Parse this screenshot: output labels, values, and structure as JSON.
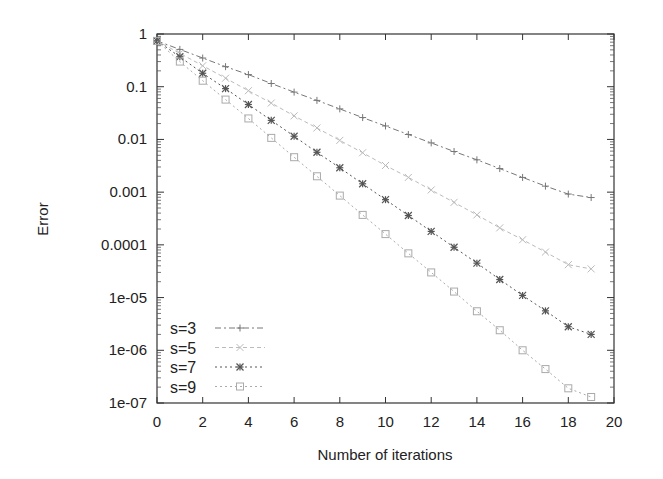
{
  "chart_data": {
    "type": "line",
    "title": "",
    "xlabel": "Number of iterations",
    "ylabel": "Error",
    "xscale": "linear",
    "yscale": "log",
    "xlim": [
      0,
      20
    ],
    "ylim": [
      1e-07,
      1
    ],
    "grid": false,
    "legend_position": "lower left",
    "x_ticks": [
      "0",
      "2",
      "4",
      "6",
      "8",
      "10",
      "12",
      "14",
      "16",
      "18",
      "20"
    ],
    "y_ticks": [
      "1",
      "0.1",
      "0.01",
      "0.001",
      "0.0001",
      "1e-05",
      "1e-06",
      "1e-07"
    ],
    "x": [
      0,
      1,
      2,
      3,
      4,
      5,
      6,
      7,
      8,
      9,
      10,
      11,
      12,
      13,
      14,
      15,
      16,
      17,
      18,
      19
    ],
    "series": [
      {
        "name": "s=3",
        "marker": "plus",
        "line_style": "dash-dot",
        "color": "#777777",
        "values": [
          0.74,
          0.51,
          0.35,
          0.24,
          0.17,
          0.115,
          0.079,
          0.055,
          0.038,
          0.026,
          0.018,
          0.0124,
          0.0086,
          0.0059,
          0.0041,
          0.0028,
          0.0019,
          0.0013,
          0.00092,
          0.00079
        ]
      },
      {
        "name": "s=5",
        "marker": "x",
        "line_style": "dashed",
        "color": "#bbbbbb",
        "values": [
          0.74,
          0.43,
          0.25,
          0.145,
          0.084,
          0.049,
          0.028,
          0.0165,
          0.0096,
          0.0056,
          0.0032,
          0.0019,
          0.0011,
          0.00064,
          0.00037,
          0.00021,
          0.000125,
          7.3e-05,
          4.2e-05,
          3.5e-05
        ]
      },
      {
        "name": "s=7",
        "marker": "star",
        "line_style": "dotted",
        "color": "#555555",
        "values": [
          0.74,
          0.37,
          0.18,
          0.092,
          0.046,
          0.023,
          0.0115,
          0.0057,
          0.0029,
          0.00144,
          0.00072,
          0.00036,
          0.00018,
          9e-05,
          4.5e-05,
          2.2e-05,
          1.1e-05,
          5.6e-06,
          2.8e-06,
          2e-06
        ]
      },
      {
        "name": "s=9",
        "marker": "square",
        "line_style": "dotted",
        "color": "#aaaaaa",
        "values": [
          0.74,
          0.3,
          0.13,
          0.057,
          0.025,
          0.0107,
          0.0046,
          0.002,
          0.00086,
          0.00037,
          0.00016,
          6.9e-05,
          3e-05,
          1.3e-05,
          5.5e-06,
          2.4e-06,
          1e-06,
          4.4e-07,
          1.9e-07,
          1.3e-07
        ]
      }
    ]
  }
}
